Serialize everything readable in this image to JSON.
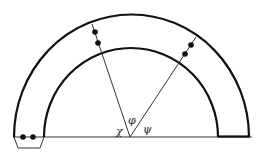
{
  "diagram": {
    "type": "semicircular-annulus-angle-diagram",
    "labels": {
      "chi": "χ",
      "phi": "φ",
      "psi": "ψ"
    },
    "colors": {
      "stroke": "#111111",
      "background": "#ffffff"
    }
  }
}
